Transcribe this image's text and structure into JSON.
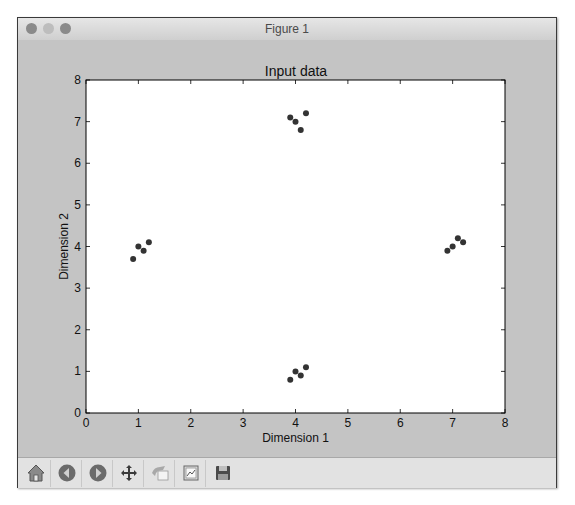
{
  "window": {
    "title": "Figure 1",
    "buttons": [
      "close",
      "minimize",
      "maximize"
    ]
  },
  "toolbar": {
    "items": [
      {
        "name": "home",
        "icon": "home-icon"
      },
      {
        "name": "back",
        "icon": "arrow-left-icon"
      },
      {
        "name": "forward",
        "icon": "arrow-right-icon"
      },
      {
        "name": "pan",
        "icon": "move-icon"
      },
      {
        "name": "zoom",
        "icon": "zoom-rect-icon"
      },
      {
        "name": "subplots",
        "icon": "subplots-icon"
      },
      {
        "name": "save",
        "icon": "save-icon"
      }
    ]
  },
  "chart_data": {
    "type": "scatter",
    "title": "Input data",
    "xlabel": "Dimension 1",
    "ylabel": "Dimension 2",
    "xlim": [
      0,
      8
    ],
    "ylim": [
      0,
      8
    ],
    "xticks": [
      0,
      1,
      2,
      3,
      4,
      5,
      6,
      7,
      8
    ],
    "yticks": [
      0,
      1,
      2,
      3,
      4,
      5,
      6,
      7,
      8
    ],
    "grid": false,
    "marker_color": "#333333",
    "series": [
      {
        "name": "data",
        "x": [
          0.9,
          1.0,
          1.1,
          1.2,
          3.9,
          4.0,
          4.1,
          4.2,
          3.9,
          4.0,
          4.1,
          4.2,
          6.9,
          7.0,
          7.1,
          7.2
        ],
        "y": [
          3.7,
          4.0,
          3.9,
          4.1,
          7.1,
          7.0,
          6.8,
          7.2,
          0.8,
          1.0,
          0.9,
          1.1,
          3.9,
          4.0,
          4.2,
          4.1
        ]
      }
    ]
  }
}
